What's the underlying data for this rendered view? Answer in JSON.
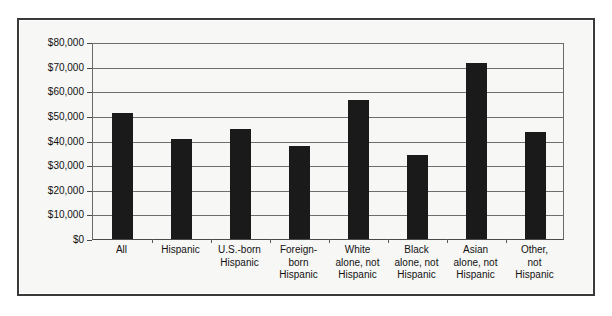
{
  "chart_data": {
    "type": "bar",
    "title": "",
    "xlabel": "",
    "ylabel": "",
    "categories": [
      "All",
      "Hispanic",
      "U.S.-born\nHispanic",
      "Foreign-\nborn\nHispanic",
      "White\nalone, not\nHispanic",
      "Black\nalone, not\nHispanic",
      "Asian\nalone, not\nHispanic",
      "Other,\nnot\nHispanic"
    ],
    "values": [
      51200,
      40500,
      44700,
      37800,
      56500,
      34300,
      71500,
      43500
    ],
    "ylim": [
      0,
      80000
    ],
    "ytick_values": [
      0,
      10000,
      20000,
      30000,
      40000,
      50000,
      60000,
      70000,
      80000
    ],
    "ytick_labels": [
      "$0",
      "$10,000",
      "$20,000",
      "$30,000",
      "$40,000",
      "$50,000",
      "$60,000",
      "$70,000",
      "$80,000"
    ],
    "grid": true,
    "legend": false,
    "bar_color": "#1a1a1a",
    "plot_background": "#f7f7f5",
    "axis_color": "#4a4a4a",
    "gridline_color": "#6e6e6e"
  }
}
